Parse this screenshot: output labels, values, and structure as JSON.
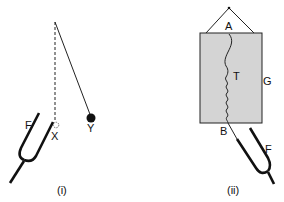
{
  "figure": {
    "panels": [
      {
        "caption": "(i)",
        "labels": {
          "fork": "F",
          "contact_point": "X",
          "bob": "Y"
        },
        "description": "Tuning fork F touching a pendulum bob at X; second pendulum Y displaced on a string from the same pivot"
      },
      {
        "caption": "(ii)",
        "labels": {
          "top": "A",
          "spring": "T",
          "plate": "G",
          "bottom": "B",
          "fork": "F"
        },
        "description": "Spring T hanging in front of a rectangular plate G, attached at A and B; tuning fork F connected at B"
      }
    ],
    "colors": {
      "ink": "#111111",
      "plate_fill": "#d4d4d4",
      "background": "#ffffff"
    }
  }
}
